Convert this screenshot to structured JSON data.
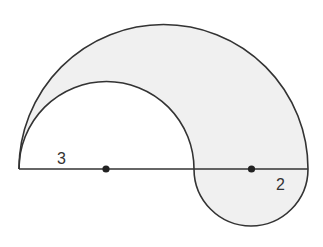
{
  "figure": {
    "type": "geometry-diagram",
    "colors": {
      "background": "#ffffff",
      "fill": "#f0f0f0",
      "stroke": "#333333"
    },
    "labels": {
      "left_radius": "3",
      "right_radius": "2"
    },
    "points": [
      {
        "name": "center-small-semicircle"
      },
      {
        "name": "center-lower-semicircle"
      }
    ]
  }
}
